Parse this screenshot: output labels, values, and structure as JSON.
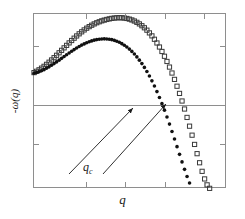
{
  "figure": {
    "width": 245,
    "height": 219,
    "background": "#ffffff"
  },
  "axes": {
    "frame_color": "#8e8e8e",
    "left_px": 33,
    "top_px": 13,
    "width_px": 193,
    "height_px": 175,
    "zero_line_y_px": 91,
    "xlabel": "q",
    "ylabel": "-ω(q)",
    "x_ticks_norm": [
      0.27,
      0.47,
      0.68,
      0.88
    ],
    "y_ticks_norm": [
      0.18,
      0.74
    ]
  },
  "annotations": {
    "qc_label": "q",
    "qc_subscript": "c",
    "qc_color": "#1a1a1a",
    "arrows": [
      {
        "x1": 69,
        "y1": 174,
        "x2": 133,
        "y2": 108,
        "name": "arrow-to-filled-curve"
      },
      {
        "x1": 103,
        "y1": 174,
        "x2": 166,
        "y2": 104,
        "name": "arrow-to-open-curve"
      }
    ]
  },
  "chart_data": {
    "type": "scatter",
    "title": "",
    "xlabel": "q",
    "ylabel": "-ω(q)",
    "xlim": [
      0,
      1
    ],
    "ylim": [
      -1.4,
      0.72
    ],
    "grid": false,
    "legend": null,
    "zero_reference_line": 0,
    "series": [
      {
        "name": "open-squares-upper",
        "marker": "open-square",
        "color": "#3a3a3a",
        "fill": "none",
        "marker_size": 4.2,
        "x": [
          0.0,
          0.013,
          0.026,
          0.039,
          0.052,
          0.065,
          0.078,
          0.091,
          0.104,
          0.117,
          0.13,
          0.143,
          0.156,
          0.169,
          0.182,
          0.195,
          0.208,
          0.221,
          0.234,
          0.247,
          0.26,
          0.273,
          0.286,
          0.299,
          0.312,
          0.325,
          0.338,
          0.351,
          0.364,
          0.377,
          0.39,
          0.403,
          0.416,
          0.429,
          0.442,
          0.455,
          0.468,
          0.481,
          0.494,
          0.507,
          0.52,
          0.533,
          0.546,
          0.559,
          0.572,
          0.585,
          0.598,
          0.611,
          0.624,
          0.637,
          0.65,
          0.663,
          0.676,
          0.689,
          0.702,
          0.715,
          0.728,
          0.741,
          0.754,
          0.767,
          0.78,
          0.793,
          0.806,
          0.819,
          0.832,
          0.845,
          0.858,
          0.871,
          0.884,
          0.897,
          0.91
        ],
        "y": [
          0.01,
          0.026,
          0.044,
          0.064,
          0.086,
          0.11,
          0.136,
          0.163,
          0.191,
          0.22,
          0.25,
          0.28,
          0.31,
          0.34,
          0.37,
          0.399,
          0.427,
          0.454,
          0.48,
          0.504,
          0.527,
          0.548,
          0.567,
          0.584,
          0.6,
          0.614,
          0.626,
          0.637,
          0.646,
          0.654,
          0.661,
          0.667,
          0.671,
          0.674,
          0.675,
          0.674,
          0.671,
          0.666,
          0.658,
          0.648,
          0.635,
          0.619,
          0.6,
          0.578,
          0.553,
          0.524,
          0.491,
          0.455,
          0.414,
          0.369,
          0.32,
          0.266,
          0.208,
          0.145,
          0.077,
          0.005,
          -0.072,
          -0.155,
          -0.242,
          -0.334,
          -0.431,
          -0.533,
          -0.639,
          -0.748,
          -0.86,
          -0.972,
          -1.082,
          -1.186,
          -1.278,
          -1.35,
          -1.392
        ]
      },
      {
        "name": "filled-circles-lower",
        "marker": "filled-circle",
        "color": "#111111",
        "fill": "#111111",
        "marker_size": 3.6,
        "x": [
          0.0,
          0.013,
          0.026,
          0.039,
          0.052,
          0.065,
          0.078,
          0.091,
          0.104,
          0.117,
          0.13,
          0.143,
          0.156,
          0.169,
          0.182,
          0.195,
          0.208,
          0.221,
          0.234,
          0.247,
          0.26,
          0.273,
          0.286,
          0.299,
          0.312,
          0.325,
          0.338,
          0.351,
          0.364,
          0.377,
          0.39,
          0.403,
          0.416,
          0.429,
          0.442,
          0.455,
          0.468,
          0.481,
          0.494,
          0.507,
          0.52,
          0.533,
          0.546,
          0.559,
          0.572,
          0.585,
          0.598,
          0.611,
          0.624,
          0.637,
          0.65,
          0.663,
          0.676,
          0.689,
          0.702,
          0.715,
          0.728,
          0.741,
          0.754,
          0.767,
          0.78,
          0.793,
          0.806
        ],
        "y": [
          0.002,
          0.01,
          0.02,
          0.032,
          0.046,
          0.062,
          0.08,
          0.099,
          0.119,
          0.14,
          0.161,
          0.183,
          0.205,
          0.227,
          0.248,
          0.269,
          0.289,
          0.308,
          0.326,
          0.343,
          0.358,
          0.372,
          0.384,
          0.394,
          0.403,
          0.41,
          0.415,
          0.418,
          0.419,
          0.418,
          0.415,
          0.409,
          0.401,
          0.39,
          0.377,
          0.361,
          0.342,
          0.32,
          0.295,
          0.267,
          0.235,
          0.2,
          0.161,
          0.119,
          0.073,
          0.023,
          -0.031,
          -0.09,
          -0.153,
          -0.22,
          -0.291,
          -0.366,
          -0.445,
          -0.528,
          -0.614,
          -0.703,
          -0.794,
          -0.887,
          -0.98,
          -1.072,
          -1.162,
          -1.248,
          -1.328
        ]
      }
    ]
  }
}
